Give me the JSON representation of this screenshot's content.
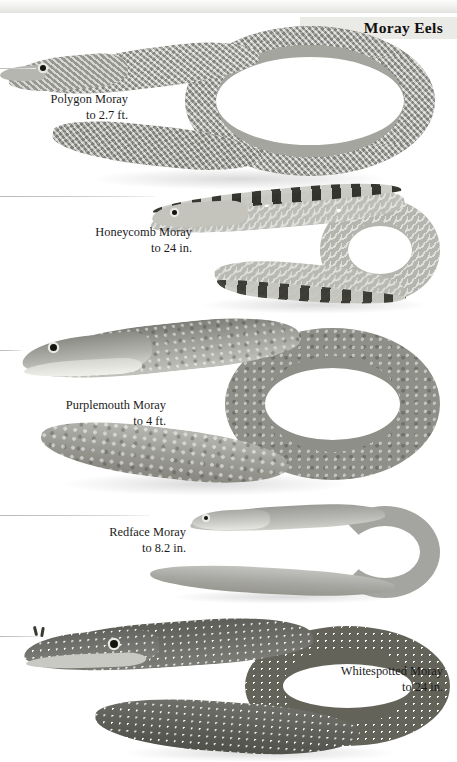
{
  "plate": {
    "title": "Moray Eels",
    "background_color": "#ffffff",
    "header_band_color": "#eaeae7",
    "ink_color": "#1a1a1a"
  },
  "species": [
    {
      "id": "polygon-moray",
      "common_name": "Polygon Moray",
      "size_text": "to 2.7 ft.",
      "pattern": "reticulated polygonal network, pale grey",
      "body_color": "#a7a7a2"
    },
    {
      "id": "honeycomb-moray",
      "common_name": "Honeycomb Moray",
      "size_text": "to 24 in.",
      "pattern": "honeycomb rosettes with dark dorsal blotches",
      "body_color": "#bdbdb7"
    },
    {
      "id": "purplemouth-moray",
      "common_name": "Purplemouth Moray",
      "size_text": "to 4 ft.",
      "pattern": "finely mottled dark grey",
      "body_color": "#8f8f89"
    },
    {
      "id": "redface-moray",
      "common_name": "Redface Moray",
      "size_text": "to 8.2 in.",
      "pattern": "plain smooth grey, unmarked",
      "body_color": "#a4a4a0"
    },
    {
      "id": "whitespotted-moray",
      "common_name": "Whitespotted Moray",
      "size_text": "to 24 in.",
      "pattern": "dark body covered in dense small white spots",
      "body_color": "#636359"
    }
  ]
}
